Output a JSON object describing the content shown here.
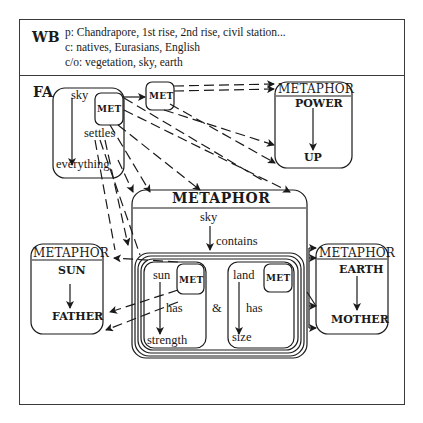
{
  "wb": {
    "label": "WB",
    "lines": [
      "p: Chandrapore, 1st rise, 2nd rise, civil station...",
      "c: natives, Eurasians, English",
      "c/o: vegetation, sky, earth"
    ]
  },
  "fa": {
    "label": "FA",
    "top": "sky",
    "relation": "settles",
    "bottom": "everything",
    "met": "MET"
  },
  "standalone_met": "MET",
  "metaphors": {
    "power": {
      "header": "METAPHOR",
      "source": "POWER",
      "target": "UP"
    },
    "sky": {
      "header": "METAPHOR",
      "top": "sky",
      "relation": "contains",
      "conjunction": "&",
      "left": {
        "top": "sun",
        "relation": "has",
        "bottom": "strength",
        "met": "MET"
      },
      "right": {
        "top": "land",
        "relation": "has",
        "bottom": "size",
        "met": "MET"
      }
    },
    "sun": {
      "header": "METAPHOR",
      "source": "SUN",
      "target": "FATHER"
    },
    "earth": {
      "header": "METAPHOR",
      "source": "EARTH",
      "target": "MOTHER"
    }
  },
  "colors": {
    "line": "#1a1a1a",
    "frame": "#3a3a3a",
    "background": "#ffffff"
  }
}
